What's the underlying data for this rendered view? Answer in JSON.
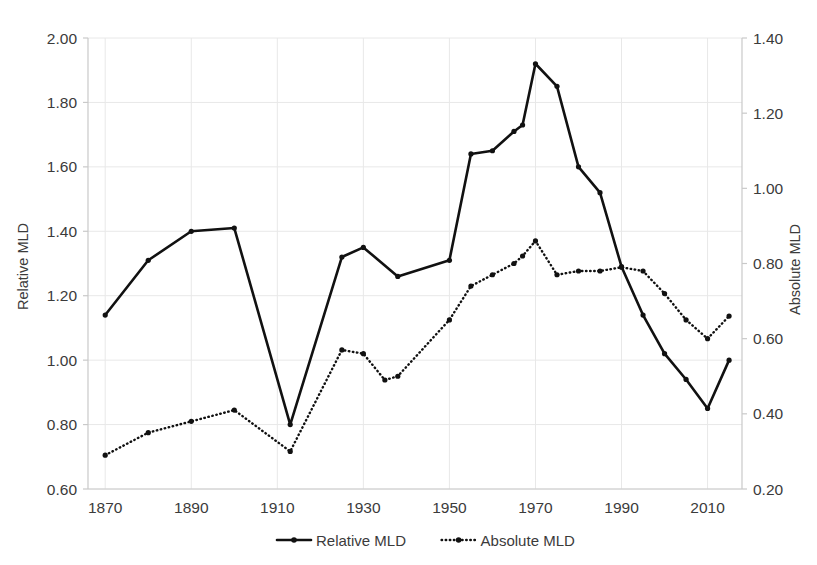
{
  "chart_data": {
    "type": "line",
    "title": "",
    "xlabel": "",
    "ylabel": "Relative MLD",
    "y2label": "Absolute MLD",
    "xlim": [
      1866,
      2018
    ],
    "ylim": [
      0.6,
      2.0
    ],
    "y2lim": [
      0.2,
      1.4
    ],
    "grid": true,
    "legend_position": "bottom",
    "x_ticks": [
      "1870",
      "1890",
      "1910",
      "1930",
      "1950",
      "1970",
      "1990",
      "2010"
    ],
    "x_tick_values": [
      1870,
      1890,
      1910,
      1930,
      1950,
      1970,
      1990,
      2010
    ],
    "y_ticks": [
      "0.60",
      "0.80",
      "1.00",
      "1.20",
      "1.40",
      "1.60",
      "1.80",
      "2.00"
    ],
    "y_tick_values": [
      0.6,
      0.8,
      1.0,
      1.2,
      1.4,
      1.6,
      1.8,
      2.0
    ],
    "y2_ticks": [
      "0.20",
      "0.40",
      "0.60",
      "0.80",
      "1.00",
      "1.20",
      "1.40"
    ],
    "y2_tick_values": [
      0.2,
      0.4,
      0.6,
      0.8,
      1.0,
      1.2,
      1.4
    ],
    "series": [
      {
        "name": "Relative MLD",
        "axis": "left",
        "style": "solid",
        "color": "#111111",
        "x": [
          1870,
          1880,
          1890,
          1900,
          1913,
          1925,
          1930,
          1938,
          1950,
          1955,
          1960,
          1965,
          1967,
          1970,
          1975,
          1980,
          1985,
          1990,
          1995,
          2000,
          2005,
          2010,
          2015
        ],
        "values": [
          1.14,
          1.31,
          1.4,
          1.41,
          0.8,
          1.32,
          1.35,
          1.26,
          1.31,
          1.64,
          1.65,
          1.71,
          1.73,
          1.92,
          1.85,
          1.6,
          1.52,
          1.29,
          1.14,
          1.02,
          0.94,
          0.85,
          1.0
        ]
      },
      {
        "name": "Absolute MLD",
        "axis": "right",
        "style": "dotted",
        "color": "#111111",
        "x": [
          1870,
          1880,
          1890,
          1900,
          1913,
          1925,
          1930,
          1935,
          1938,
          1950,
          1955,
          1960,
          1965,
          1967,
          1970,
          1975,
          1980,
          1985,
          1990,
          1995,
          2000,
          2005,
          2010,
          2015
        ],
        "values": [
          0.29,
          0.35,
          0.38,
          0.41,
          0.3,
          0.57,
          0.56,
          0.49,
          0.5,
          0.65,
          0.74,
          0.77,
          0.8,
          0.82,
          0.86,
          0.77,
          0.78,
          0.78,
          0.79,
          0.78,
          0.72,
          0.65,
          0.6,
          0.66
        ]
      }
    ],
    "legend": [
      {
        "label": "Relative MLD",
        "style": "solid"
      },
      {
        "label": "Absolute MLD",
        "style": "dotted"
      }
    ]
  }
}
